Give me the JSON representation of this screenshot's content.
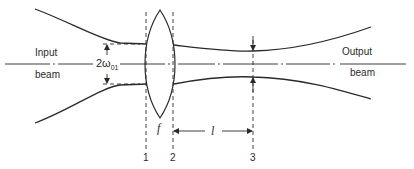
{
  "diagram": {
    "type": "gaussian-beam-lens-focusing",
    "labels": {
      "input_line1": "Input",
      "input_line2": "beam",
      "output_line1": "Output",
      "output_line2": "beam",
      "waist_prefix": "2ω",
      "waist_subscript": "01",
      "focal_length": "f",
      "distance": "l",
      "plane_1": "1",
      "plane_2": "2",
      "plane_3": "3"
    },
    "colors": {
      "line": "#2a2a2a",
      "background": "#ffffff"
    }
  }
}
